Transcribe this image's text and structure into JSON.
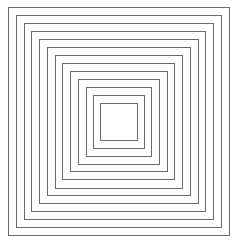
{
  "figure": {
    "count": 13,
    "stroke_color": "#6a6a6a",
    "background": "#ffffff",
    "squares": [
      {
        "left": 8,
        "top": 7,
        "right": 230,
        "bottom": 236
      },
      {
        "left": 16,
        "top": 15,
        "right": 222,
        "bottom": 228
      },
      {
        "left": 24,
        "top": 23,
        "right": 214,
        "bottom": 220
      },
      {
        "left": 31,
        "top": 31,
        "right": 206,
        "bottom": 212
      },
      {
        "left": 39,
        "top": 39,
        "right": 199,
        "bottom": 204
      },
      {
        "left": 47,
        "top": 47,
        "right": 191,
        "bottom": 196
      },
      {
        "left": 55,
        "top": 55,
        "right": 183,
        "bottom": 189
      },
      {
        "left": 62,
        "top": 63,
        "right": 175,
        "bottom": 180
      },
      {
        "left": 70,
        "top": 71,
        "right": 168,
        "bottom": 172
      },
      {
        "left": 78,
        "top": 79,
        "right": 160,
        "bottom": 165
      },
      {
        "left": 86,
        "top": 87,
        "right": 152,
        "bottom": 157
      },
      {
        "left": 93,
        "top": 95,
        "right": 145,
        "bottom": 149
      },
      {
        "left": 100,
        "top": 103,
        "right": 138,
        "bottom": 141
      }
    ]
  }
}
